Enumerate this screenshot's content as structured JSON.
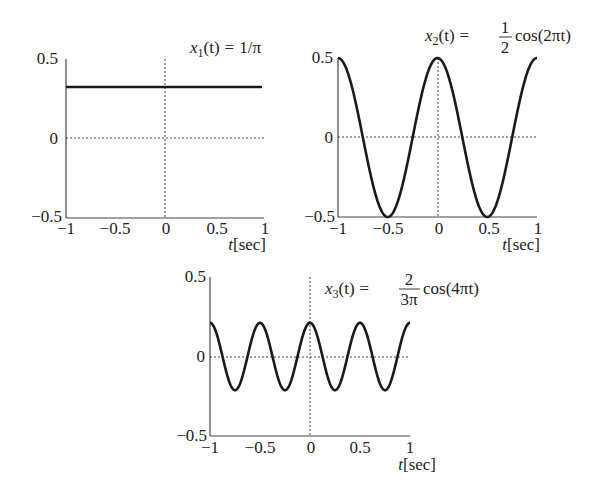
{
  "chart_data": [
    {
      "type": "line",
      "title": "x_1(t) = 1/π",
      "title_parts": {
        "lhs": "x",
        "sub": "1",
        "arg": "(t)",
        "eq": "=",
        "rhs": "1/π"
      },
      "xlabel": "t[sec]",
      "ylabel": "",
      "xlim": [
        -1,
        1
      ],
      "ylim": [
        -0.5,
        0.5
      ],
      "xticks": [
        "−1",
        "−0.5",
        "0",
        "0.5",
        "1"
      ],
      "yticks": [
        "0.5",
        "0",
        "−0.5"
      ],
      "grid": "dotted lines at x=0 and y=0",
      "series": [
        {
          "name": "x1(t)",
          "function": "1/pi",
          "constant": 0.318
        }
      ]
    },
    {
      "type": "line",
      "title": "x_2(t) = (1/2) cos(2πt)",
      "title_parts": {
        "lhs": "x",
        "sub": "2",
        "arg": "(t)",
        "eq": "=",
        "num": "1",
        "den": "2",
        "rhs": "cos(2πt)"
      },
      "xlabel": "t[sec]",
      "ylabel": "",
      "xlim": [
        -1,
        1
      ],
      "ylim": [
        -0.5,
        0.5
      ],
      "xticks": [
        "−1",
        "−0.5",
        "0",
        "0.5",
        "1"
      ],
      "yticks": [
        "0.5",
        "0",
        "−0.5"
      ],
      "grid": "dotted lines at x=0 and y=0",
      "series": [
        {
          "name": "x2(t)",
          "function": "0.5*cos(2*pi*t)",
          "amplitude": 0.5,
          "frequency_hz": 1,
          "x": [
            -1,
            -0.75,
            -0.5,
            -0.25,
            0,
            0.25,
            0.5,
            0.75,
            1
          ],
          "y": [
            0.5,
            0,
            -0.5,
            0,
            0.5,
            0,
            -0.5,
            0,
            0.5
          ]
        }
      ]
    },
    {
      "type": "line",
      "title": "x_3(t) = (2/(3π)) cos(4πt)",
      "title_parts": {
        "lhs": "x",
        "sub": "3",
        "arg": "(t)",
        "eq": "=",
        "num": "2",
        "den": "3π",
        "rhs": "cos(4πt)"
      },
      "xlabel": "t[sec]",
      "ylabel": "",
      "xlim": [
        -1,
        1
      ],
      "ylim": [
        -0.5,
        0.5
      ],
      "xticks": [
        "−1",
        "−0.5",
        "0",
        "0.5",
        "1"
      ],
      "yticks": [
        "0.5",
        "0",
        "−0.5"
      ],
      "grid": "dotted lines at x=0 and y=0",
      "series": [
        {
          "name": "x3(t)",
          "function": "(2/(3*pi))*cos(4*pi*t)",
          "amplitude": 0.212,
          "frequency_hz": 2,
          "x": [
            -1,
            -0.75,
            -0.5,
            -0.25,
            0,
            0.25,
            0.5,
            0.75,
            1
          ],
          "y": [
            0.212,
            -0.212,
            0.212,
            -0.212,
            0.212,
            -0.212,
            0.212,
            -0.212,
            0.212
          ]
        }
      ]
    }
  ]
}
